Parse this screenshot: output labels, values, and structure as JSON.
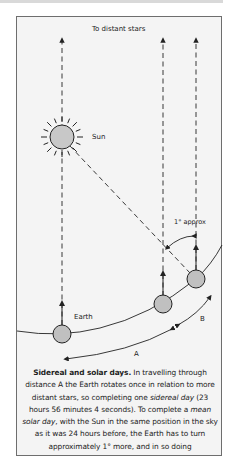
{
  "diagram": {
    "labels": {
      "top": "To distant stars",
      "sun": "Sun",
      "earth": "Earth",
      "angle": "1° approx",
      "distance_a": "A",
      "distance_b": "B"
    },
    "colors": {
      "frame_bg": "#f4f4f4",
      "body_fill": "#c8c8c8",
      "line": "#222222"
    }
  },
  "caption": {
    "title": "Sidereal and solar days.",
    "text_1": " In travelling through distance A the Earth rotates once in relation to more distant stars, so completing one ",
    "term_1": "sidereal day",
    "text_2": " (23 hours 56 minutes 4 seconds). To complete a ",
    "term_2": "mean solar day",
    "text_3": ", with the Sun in the same position in the sky as it was 24 hours before, the Earth has to turn approximately 1° more, and in so doing"
  }
}
